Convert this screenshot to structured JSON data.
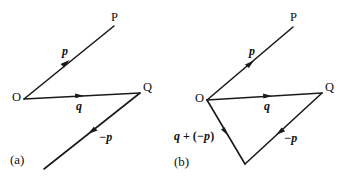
{
  "figure": {
    "background_color": "#ffffff",
    "ink_color": "#1a1a1a",
    "width": 353,
    "height": 180
  },
  "panels": [
    {
      "id": "a",
      "caption": "(a)",
      "points": {
        "origin_label": "O",
        "p_tip_label": "P",
        "q_tip_label": "Q"
      },
      "vectors": [
        {
          "name": "p",
          "label": "p",
          "from": "O",
          "to": "P"
        },
        {
          "name": "q",
          "label": "q",
          "from": "O",
          "to": "Q"
        },
        {
          "name": "minus_p",
          "label": "−p",
          "from": "Q",
          "to": "free-end"
        }
      ]
    },
    {
      "id": "b",
      "caption": "(b)",
      "points": {
        "origin_label": "O",
        "p_tip_label": "P",
        "q_tip_label": "Q"
      },
      "vectors": [
        {
          "name": "p",
          "label": "p",
          "from": "O",
          "to": "P"
        },
        {
          "name": "q",
          "label": "q",
          "from": "O",
          "to": "Q"
        },
        {
          "name": "minus_p",
          "label": "−p",
          "from": "Q",
          "to": "R"
        },
        {
          "name": "q_plus_minus_p",
          "label_full": "q + (−p)",
          "label_lead": "q",
          "label_op": " + (",
          "label_sym": "−p",
          "label_close": ")",
          "from": "O",
          "to": "R"
        }
      ]
    }
  ]
}
